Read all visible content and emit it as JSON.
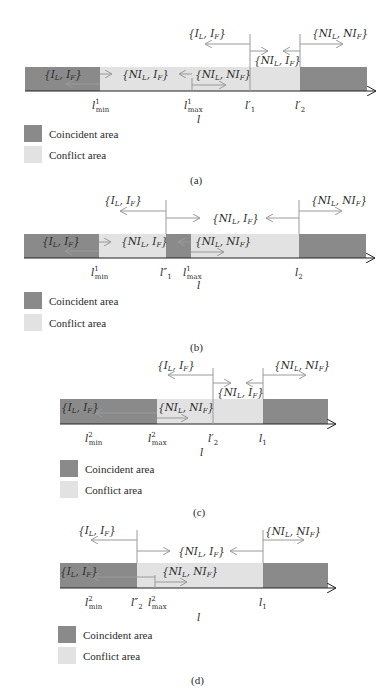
{
  "colors": {
    "coincident": "#8a8a8a",
    "conflict": "#e2e2e2",
    "arrow": "#9a9a9a",
    "axis": "#222222"
  },
  "legend": {
    "coincident_label": "Coincident area",
    "conflict_label": "Conflict area"
  },
  "axis_variable": "l",
  "panels": [
    {
      "caption": "(a)",
      "regions": [
        {
          "type": "coincident",
          "from": 25,
          "to": 100
        },
        {
          "type": "conflict",
          "from": 100,
          "to": 300
        },
        {
          "type": "coincident",
          "from": 300,
          "to": 367
        }
      ],
      "ticks": [
        {
          "label": "l",
          "sup": "1",
          "sub": "min",
          "x": 100
        },
        {
          "label": "l",
          "sup": "1",
          "sub": "max",
          "x": 193
        },
        {
          "label": "l′",
          "sup": "",
          "sub": "1",
          "x": 250
        },
        {
          "label": "l′",
          "sup": "",
          "sub": "2",
          "x": 300
        }
      ],
      "sets": [
        {
          "text": "{I_L, I_F}",
          "where": "bar-left"
        },
        {
          "text": "{NI_L, I_F}",
          "where": "bar-mid"
        },
        {
          "text": "{NI_L, NI_F}",
          "where": "bar-right"
        },
        {
          "text": "{I_L, I_F}",
          "where": "above"
        },
        {
          "text": "{NI_L, I_F}",
          "where": "between"
        },
        {
          "text": "{NI_L, NI_F}",
          "where": "above-right"
        }
      ]
    },
    {
      "caption": "(b)",
      "regions": [
        {
          "type": "coincident",
          "from": 24,
          "to": 99
        },
        {
          "type": "conflict",
          "from": 99,
          "to": 166
        },
        {
          "type": "coincident",
          "from": 166,
          "to": 191
        },
        {
          "type": "conflict",
          "from": 191,
          "to": 299
        },
        {
          "type": "coincident",
          "from": 299,
          "to": 366
        }
      ],
      "ticks": [
        {
          "label": "l",
          "sup": "1",
          "sub": "min",
          "x": 99
        },
        {
          "label": "l″",
          "sup": "",
          "sub": "1",
          "x": 166
        },
        {
          "label": "l",
          "sup": "1",
          "sub": "max",
          "x": 191
        },
        {
          "label": "l",
          "sup": "",
          "sub": "2",
          "x": 299
        }
      ],
      "sets": [
        {
          "text": "{I_L, I_F}",
          "where": "bar-left"
        },
        {
          "text": "{NI_L, I_F}",
          "where": "bar-mid"
        },
        {
          "text": "{NI_L, NI_F}",
          "where": "bar-right"
        },
        {
          "text": "{I_L, I_F}",
          "where": "above"
        },
        {
          "text": "{NI_L, I_F}",
          "where": "between"
        },
        {
          "text": "{NI_L, NI_F}",
          "where": "above-right"
        }
      ]
    },
    {
      "caption": "(c)",
      "regions": [
        {
          "type": "coincident",
          "from": 60,
          "to": 157
        },
        {
          "type": "conflict",
          "from": 157,
          "to": 263
        },
        {
          "type": "coincident",
          "from": 263,
          "to": 328
        }
      ],
      "ticks": [
        {
          "label": "l",
          "sup": "2",
          "sub": "min",
          "x": 90
        },
        {
          "label": "l",
          "sup": "2",
          "sub": "max",
          "x": 157
        },
        {
          "label": "l′",
          "sup": "",
          "sub": "2",
          "x": 213
        },
        {
          "label": "l",
          "sup": "",
          "sub": "1",
          "x": 263
        }
      ],
      "sets": [
        {
          "text": "{I_L, I_F}",
          "where": "bar-left"
        },
        {
          "text": "{NI_L, NI_F}",
          "where": "bar-right"
        },
        {
          "text": "{I_L, I_F}",
          "where": "above"
        },
        {
          "text": "{NI_L, I_F}",
          "where": "between"
        },
        {
          "text": "{NI_L, NI_F}",
          "where": "above-right"
        }
      ]
    },
    {
      "caption": "(d)",
      "regions": [
        {
          "type": "coincident",
          "from": 60,
          "to": 137
        },
        {
          "type": "conflict",
          "from": 137,
          "to": 263
        },
        {
          "type": "coincident",
          "from": 263,
          "to": 328
        }
      ],
      "ticks": [
        {
          "label": "l",
          "sup": "2",
          "sub": "min",
          "x": 90
        },
        {
          "label": "l″",
          "sup": "",
          "sub": "2",
          "x": 137
        },
        {
          "label": "l",
          "sup": "2",
          "sub": "max",
          "x": 155
        },
        {
          "label": "l",
          "sup": "",
          "sub": "1",
          "x": 263
        }
      ],
      "sets": [
        {
          "text": "{I_L, I_F}",
          "where": "bar-left"
        },
        {
          "text": "{NI_L, NI_F}",
          "where": "bar-right"
        },
        {
          "text": "{I_L, I_F}",
          "where": "above"
        },
        {
          "text": "{NI_L, I_F}",
          "where": "between"
        },
        {
          "text": "{NI_L, NI_F}",
          "where": "above-right"
        }
      ]
    }
  ],
  "text": {
    "ILIF": "{I",
    "NILIF": "{NI",
    "L": "L",
    "F": "F",
    "comma_I": ", I",
    "comma_NI": ", NI",
    "close": "}",
    "l": "l",
    "lprime": "l′",
    "ldprime": "l″",
    "min": "min",
    "max": "max",
    "one": "1",
    "two": "2"
  }
}
